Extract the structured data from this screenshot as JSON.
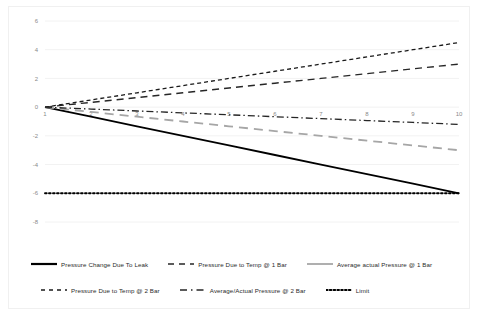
{
  "chart_data": {
    "type": "line",
    "title": "",
    "xlabel": "",
    "ylabel": "",
    "x": [
      1,
      2,
      3,
      4,
      5,
      6,
      7,
      8,
      9,
      10
    ],
    "xticks": [
      "1",
      "2",
      "3",
      "4",
      "5",
      "6",
      "7",
      "8",
      "9",
      "10"
    ],
    "yticks": [
      "6",
      "4",
      "2",
      "0",
      "-2",
      "-4",
      "-6",
      "-8"
    ],
    "xlim": [
      1,
      10
    ],
    "ylim": [
      -8,
      6
    ],
    "grid": true,
    "legend_position": "bottom",
    "series": [
      {
        "name": "Pressure Change Due To Leak",
        "style": "solid",
        "color": "#000000",
        "width": 1.8,
        "values": [
          0,
          -0.667,
          -1.333,
          -2,
          -2.667,
          -3.333,
          -4,
          -4.667,
          -5.333,
          -6
        ]
      },
      {
        "name": "Pressure Due to Temp @ 1 Bar",
        "style": "dashed",
        "color": "#262626",
        "width": 1.4,
        "values": [
          0,
          0.333,
          0.667,
          1,
          1.333,
          1.667,
          2,
          2.333,
          2.667,
          3
        ]
      },
      {
        "name": "Average actual Pressure @ 1 Bar",
        "style": "long-dash",
        "color": "#a6a6a6",
        "width": 1.8,
        "values": [
          0,
          -0.333,
          -0.667,
          -1,
          -1.333,
          -1.667,
          -2,
          -2.333,
          -2.667,
          -3
        ]
      },
      {
        "name": "Pressure Due to Temp @ 2 Bar",
        "style": "fine-dash",
        "color": "#1a1a1a",
        "width": 1.3,
        "values": [
          0,
          0.5,
          1,
          1.5,
          2,
          2.5,
          3,
          3.5,
          4,
          4.5
        ]
      },
      {
        "name": "Average/Actual Pressure @ 2 Bar",
        "style": "dash-dot",
        "color": "#262626",
        "width": 1.3,
        "values": [
          0,
          -0.133,
          -0.267,
          -0.4,
          -0.533,
          -0.667,
          -0.8,
          -0.933,
          -1.067,
          -1.2
        ]
      },
      {
        "name": "Limit",
        "style": "dotted",
        "color": "#000000",
        "width": 1.9,
        "values": [
          -6,
          -6,
          -6,
          -6,
          -6,
          -6,
          -6,
          -6,
          -6,
          -6
        ]
      }
    ]
  },
  "legend": {
    "rows": [
      [
        {
          "label": "Pressure Change Due To Leak",
          "style": "solid",
          "color": "#000000"
        },
        {
          "label": "Pressure Due to Temp @ 1 Bar",
          "style": "dashed",
          "color": "#262626"
        },
        {
          "label": "Average actual Pressure @ 1 Bar",
          "style": "long-dash",
          "color": "#a6a6a6"
        }
      ],
      [
        {
          "label": "Pressure Due to Temp @ 2 Bar",
          "style": "fine-dash",
          "color": "#1a1a1a"
        },
        {
          "label": "Average/Actual Pressure @ 2 Bar",
          "style": "dash-dot",
          "color": "#262626"
        },
        {
          "label": "Limit",
          "style": "dotted",
          "color": "#000000"
        }
      ]
    ]
  },
  "colors": {
    "grid": "#f2f2f2",
    "tick_text": "#8a8a8a",
    "border": "#f0f0f0",
    "background": "#ffffff"
  }
}
